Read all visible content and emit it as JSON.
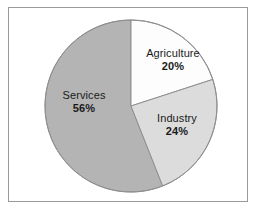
{
  "figure": {
    "background_color": "#ffffff",
    "frame_color": "#9a9a9a",
    "width": 258,
    "height": 211
  },
  "chart_data": {
    "type": "pie",
    "title": "",
    "subtitle": "",
    "xlabel": "",
    "ylabel": "",
    "legend_position": "none",
    "grid": false,
    "value_unit": "%",
    "start_angle_deg": 90,
    "direction": "clockwise",
    "categories": [
      "Agriculture",
      "Industry",
      "Services"
    ],
    "values": [
      20,
      24,
      56
    ],
    "total": 100,
    "colors": [
      "#fdfdfd",
      "#dcdcdc",
      "#b4b4b4"
    ],
    "slice_outline_color": "#8f8f8f",
    "slices": [
      {
        "label": "Agriculture",
        "value": 20,
        "value_text": "20%",
        "color": "#fdfdfd",
        "start_angle_deg": 0,
        "end_angle_deg": 72
      },
      {
        "label": "Industry",
        "value": 24,
        "value_text": "24%",
        "color": "#dcdcdc",
        "start_angle_deg": 72,
        "end_angle_deg": 158.4
      },
      {
        "label": "Services",
        "value": 56,
        "value_text": "56%",
        "color": "#b4b4b4",
        "start_angle_deg": 158.4,
        "end_angle_deg": 360
      }
    ]
  },
  "labels": {
    "agriculture": {
      "name": "Agriculture",
      "percent": "20%"
    },
    "industry": {
      "name": "Industry",
      "percent": "24%"
    },
    "services": {
      "name": "Services",
      "percent": "56%"
    }
  }
}
